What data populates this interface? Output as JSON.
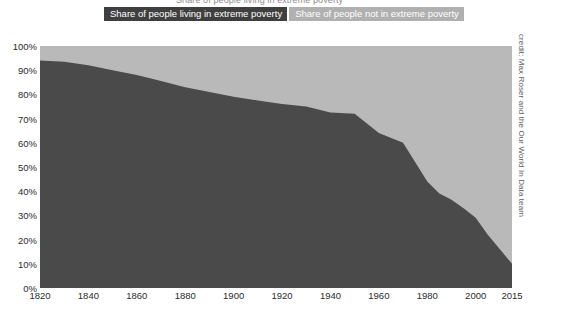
{
  "title": {
    "cropped_text": "Share of people living in extreme poverty"
  },
  "legend": {
    "position": "top",
    "items": [
      {
        "label": "Share of people living in extreme poverty",
        "color": "#3f3f3f"
      },
      {
        "label": "Share of people not in extreme poverty",
        "color": "#b0b0b0"
      }
    ]
  },
  "credit": {
    "text": "credit: Max Roser and the Our World In Data team"
  },
  "chart_data": {
    "type": "area",
    "title": "Share of people living in extreme poverty",
    "xlabel": "",
    "ylabel": "",
    "xlim": [
      1820,
      2015
    ],
    "ylim": [
      0,
      100
    ],
    "grid": false,
    "stacked": true,
    "stacked_total": 100,
    "legend_position": "top",
    "x_tick_labels": [
      "1820",
      "1840",
      "1860",
      "1880",
      "1900",
      "1920",
      "1940",
      "1960",
      "1980",
      "2000",
      "2015"
    ],
    "x_ticks": [
      1820,
      1840,
      1860,
      1880,
      1900,
      1920,
      1940,
      1960,
      1980,
      2000,
      2015
    ],
    "y_tick_labels": [
      "0%",
      "10%",
      "20%",
      "30%",
      "40%",
      "50%",
      "60%",
      "70%",
      "80%",
      "90%",
      "100%"
    ],
    "y_ticks": [
      0,
      10,
      20,
      30,
      40,
      50,
      60,
      70,
      80,
      90,
      100
    ],
    "x": [
      1820,
      1830,
      1840,
      1850,
      1860,
      1870,
      1880,
      1890,
      1900,
      1910,
      1920,
      1930,
      1940,
      1950,
      1960,
      1970,
      1980,
      1985,
      1990,
      1995,
      2000,
      2005,
      2010,
      2015
    ],
    "series": [
      {
        "name": "Share of people living in extreme poverty",
        "color": "#4a4a4a",
        "values": [
          94,
          93.5,
          92,
          90,
          88,
          85.5,
          83,
          81,
          79,
          77.5,
          76,
          75,
          72.5,
          72,
          64,
          60,
          44,
          39,
          36.5,
          33,
          29,
          22,
          16,
          10
        ]
      },
      {
        "name": "Share of people not in extreme poverty",
        "color": "#b9b9b9",
        "values": [
          6,
          6.5,
          8,
          10,
          12,
          14.5,
          17,
          19,
          21,
          22.5,
          24,
          25,
          27.5,
          28,
          36,
          40,
          56,
          61,
          63.5,
          67,
          71,
          78,
          84,
          90
        ]
      }
    ]
  }
}
